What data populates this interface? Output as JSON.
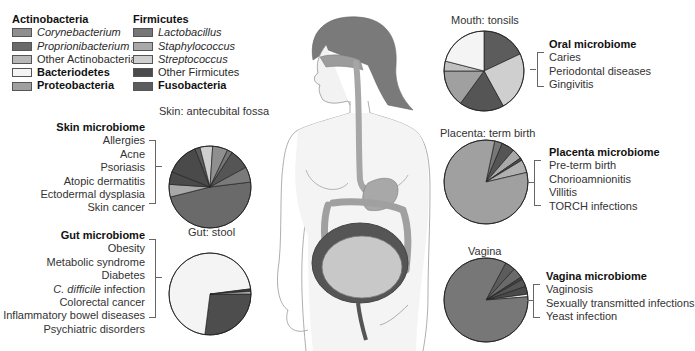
{
  "legend": {
    "col1": {
      "heading": "Actinobacteria",
      "items": [
        {
          "label": "Corynebacterium",
          "italic": true,
          "bold": false,
          "color": "#8f8f8f"
        },
        {
          "label": "Proprionibacterium",
          "italic": true,
          "bold": false,
          "color": "#6a6a6a"
        },
        {
          "label": "Other Actinobacteria",
          "italic": false,
          "bold": false,
          "color": "#b8b8b8"
        },
        {
          "label": "Bacteriodetes",
          "italic": false,
          "bold": true,
          "color": "#f4f4f4"
        },
        {
          "label": "Proteobacteria",
          "italic": false,
          "bold": true,
          "color": "#a0a0a0"
        }
      ]
    },
    "col2": {
      "heading": "Firmicutes",
      "items": [
        {
          "label": "Lactobacillus",
          "italic": true,
          "bold": false,
          "color": "#777777"
        },
        {
          "label": "Staphylococcus",
          "italic": true,
          "bold": false,
          "color": "#a9a9a9"
        },
        {
          "label": "Streptococcus",
          "italic": true,
          "bold": false,
          "color": "#cfcfcf"
        },
        {
          "label": "Other Firmicutes",
          "italic": false,
          "bold": false,
          "color": "#4a4a4a"
        },
        {
          "label": "Fusobacteria",
          "italic": false,
          "bold": true,
          "color": "#5c5c5c"
        }
      ]
    }
  },
  "sites": {
    "skin": {
      "pie_title": "Skin: antecubital fossa",
      "box_title": "Skin microbiome",
      "conditions": [
        "Allergies",
        "Acne",
        "Psoriasis",
        "Atopic dermatitis",
        "Ectodermal dysplasia",
        "Skin cancer"
      ]
    },
    "gut": {
      "pie_title": "Gut: stool",
      "box_title": "Gut microbiome",
      "conditions": [
        "Obesity",
        "Metabolic syndrome",
        "Diabetes",
        "C. difficile infection",
        "Colorectal cancer",
        "Inflammatory bowel diseases",
        "Psychiatric disorders"
      ],
      "italic_prefix_index": 3,
      "italic_prefix": "C. difficile",
      "rest": " infection"
    },
    "mouth": {
      "pie_title": "Mouth: tonsils",
      "box_title": "Oral microbiome",
      "conditions": [
        "Caries",
        "Periodontal diseases",
        "Gingivitis"
      ]
    },
    "placenta": {
      "pie_title": "Placenta: term birth",
      "box_title": "Placenta microbiome",
      "conditions": [
        "Pre-term birth",
        "Chorioamnionitis",
        "Villitis",
        "TORCH infections"
      ]
    },
    "vagina": {
      "pie_title": "Vagina",
      "box_title": "Vagina microbiome",
      "conditions": [
        "Vaginosis",
        "Sexually transmitted infections",
        "Yeast infection"
      ]
    }
  },
  "chart_data": [
    {
      "type": "pie",
      "title": "Skin: antecubital fossa",
      "start_angle_deg": -7,
      "slices": [
        {
          "label": "Proprionibacterium",
          "value": 48,
          "color": "#6a6a6a"
        },
        {
          "label": "Staphylococcus",
          "value": 5,
          "color": "#a9a9a9"
        },
        {
          "label": "Other Firmicutes",
          "value": 5,
          "color": "#4a4a4a"
        },
        {
          "label": "Other Firmicutes",
          "value": 13,
          "color": "#4a4a4a"
        },
        {
          "label": "Fusobacteria",
          "value": 2,
          "color": "#5c5c5c"
        },
        {
          "label": "Streptococcus",
          "value": 5,
          "color": "#cfcfcf"
        },
        {
          "label": "Corynebacterium",
          "value": 6,
          "color": "#8f8f8f"
        },
        {
          "label": "Lactobacillus",
          "value": 2,
          "color": "#777777"
        },
        {
          "label": "Other Firmicutes",
          "value": 8,
          "color": "#555555"
        },
        {
          "label": "Proteobacteria",
          "value": 6,
          "color": "#7a7a7a"
        }
      ]
    },
    {
      "type": "pie",
      "title": "Gut: stool",
      "start_angle_deg": 0,
      "slices": [
        {
          "label": "Other Firmicutes",
          "value": 27,
          "color": "#4d4d4d"
        },
        {
          "label": "Bacteriodetes",
          "value": 71,
          "color": "#f4f4f4"
        },
        {
          "label": "Other Firmicutes",
          "value": 1,
          "color": "#3a3a3a"
        },
        {
          "label": "Staphylococcus",
          "value": 1,
          "color": "#b8b8b8"
        }
      ]
    },
    {
      "type": "pie",
      "title": "Mouth: tonsils",
      "start_angle_deg": -90,
      "slices": [
        {
          "label": "Fusobacteria",
          "value": 18,
          "color": "#5c5c5c"
        },
        {
          "label": "Streptococcus",
          "value": 24,
          "color": "#cfcfcf"
        },
        {
          "label": "Other Firmicutes",
          "value": 18,
          "color": "#555555"
        },
        {
          "label": "Proteobacteria",
          "value": 15,
          "color": "#a0a0a0"
        },
        {
          "label": "Other Actinobacteria",
          "value": 4,
          "color": "#c0c0c0"
        },
        {
          "label": "Bacteriodetes",
          "value": 21,
          "color": "#f4f4f4"
        }
      ]
    },
    {
      "type": "pie",
      "title": "Placenta: term birth",
      "start_angle_deg": -78,
      "slices": [
        {
          "label": "Lactobacillus",
          "value": 3,
          "color": "#777777"
        },
        {
          "label": "Other Firmicutes",
          "value": 5,
          "color": "#555555"
        },
        {
          "label": "Staphylococcus",
          "value": 4,
          "color": "#a9a9a9"
        },
        {
          "label": "Other Firmicutes",
          "value": 1,
          "color": "#4a4a4a"
        },
        {
          "label": "Streptococcus",
          "value": 5,
          "color": "#b0b0b0"
        },
        {
          "label": "Proteobacteria",
          "value": 82,
          "color": "#a0a0a0"
        }
      ]
    },
    {
      "type": "pie",
      "title": "Vagina",
      "start_angle_deg": -62,
      "slices": [
        {
          "label": "Other Firmicutes",
          "value": 4,
          "color": "#5c5c5c"
        },
        {
          "label": "Proprionibacterium",
          "value": 4,
          "color": "#6a6a6a"
        },
        {
          "label": "Other Firmicutes",
          "value": 1,
          "color": "#444444"
        },
        {
          "label": "Fusobacteria",
          "value": 3,
          "color": "#555555"
        },
        {
          "label": "Other Firmicutes",
          "value": 3,
          "color": "#4a4a4a"
        },
        {
          "label": "Bacteriodetes",
          "value": 1,
          "color": "#f4f4f4"
        },
        {
          "label": "Lactobacillus",
          "value": 84,
          "color": "#777777"
        }
      ]
    }
  ],
  "pie_layout": [
    {
      "cx": 210,
      "cy": 187,
      "r": 41
    },
    {
      "cx": 210,
      "cy": 294,
      "r": 41
    },
    {
      "cx": 484,
      "cy": 71,
      "r": 40
    },
    {
      "cx": 486,
      "cy": 182,
      "r": 42
    },
    {
      "cx": 486,
      "cy": 300,
      "r": 42
    }
  ]
}
